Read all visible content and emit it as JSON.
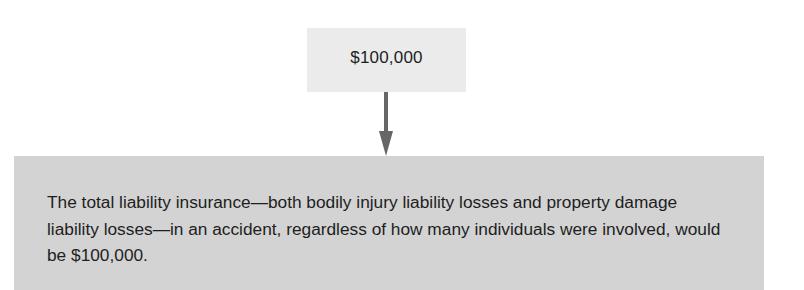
{
  "diagram": {
    "top_box": {
      "label": "$100,000"
    },
    "arrow": {
      "direction": "down",
      "color": "#666666"
    },
    "bottom_box": {
      "text": "The total liability insurance—both bodily injury liability losses and property damage liability losses—in an accident, regardless of how many individuals were involved, would be $100,000."
    },
    "colors": {
      "top_box_fill": "#ebebeb",
      "bottom_box_fill": "#d3d3d3",
      "text": "#1e1e1e"
    }
  }
}
